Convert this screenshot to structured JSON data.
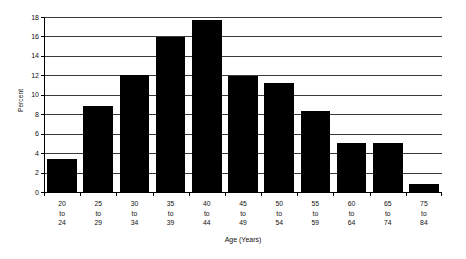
{
  "chart_data": {
    "type": "bar",
    "title": "",
    "xlabel": "Age (Years)",
    "ylabel": "Percent",
    "categories": [
      "20 to 24",
      "25 to 29",
      "30 to 34",
      "35 to 39",
      "40 to 44",
      "45 to 49",
      "50 to 54",
      "55 to 59",
      "60 to 64",
      "65 to 74",
      "75 to 84"
    ],
    "category_lines": [
      [
        "20",
        "to",
        "24"
      ],
      [
        "25",
        "to",
        "29"
      ],
      [
        "30",
        "to",
        "34"
      ],
      [
        "35",
        "to",
        "39"
      ],
      [
        "40",
        "to",
        "44"
      ],
      [
        "45",
        "to",
        "49"
      ],
      [
        "50",
        "to",
        "54"
      ],
      [
        "55",
        "to",
        "59"
      ],
      [
        "60",
        "to",
        "64"
      ],
      [
        "65",
        "to",
        "74"
      ],
      [
        "75",
        "to",
        "84"
      ]
    ],
    "values": [
      3.4,
      8.8,
      12.0,
      15.9,
      17.7,
      11.9,
      11.25,
      8.3,
      5.0,
      5.0,
      0.8
    ],
    "ylim": [
      0,
      18
    ],
    "yticks": [
      0,
      2,
      4,
      6,
      8,
      10,
      12,
      14,
      16,
      18
    ],
    "ytick_labels": [
      "0",
      "2",
      "4",
      "6",
      "8",
      "10",
      "12",
      "14",
      "16",
      "18"
    ],
    "grid": true,
    "legend": "none",
    "bar_color": "#000000",
    "grid_color": "#3a3a3a",
    "background_color": "#ffffff"
  }
}
